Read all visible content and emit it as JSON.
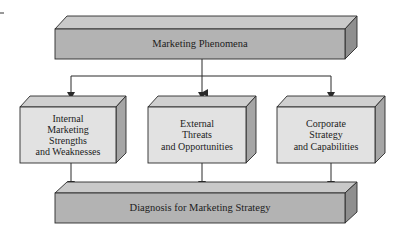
{
  "diagram": {
    "type": "flowchart",
    "colors": {
      "dark_box_front": "#b3b3b3",
      "dark_box_top": "#c9c9c9",
      "dark_box_side": "#8f8f8f",
      "light_box_front": "#e2e2e2",
      "light_box_top": "#cfcfcf",
      "light_box_side": "#a6a6a6",
      "stroke": "#2a2a2a",
      "text": "#1c1c1c"
    },
    "nodes": {
      "top": {
        "label": "Marketing Phenomena"
      },
      "internal": {
        "label": "Internal\nMarketing\nStrengths\nand Weaknesses"
      },
      "external": {
        "label": "External\nThreats\nand Opportunities"
      },
      "corporate": {
        "label": "Corporate\nStrategy\nand Capabilities"
      },
      "bottom": {
        "label": "Diagnosis for Marketing Strategy"
      }
    },
    "edges": [
      {
        "from": "Marketing Phenomena",
        "to": "Internal Marketing Strengths and Weaknesses"
      },
      {
        "from": "Marketing Phenomena",
        "to": "External Threats and Opportunities"
      },
      {
        "from": "Marketing Phenomena",
        "to": "Corporate Strategy and Capabilities"
      },
      {
        "from": "Internal Marketing Strengths and Weaknesses",
        "to": "Diagnosis for Marketing Strategy"
      },
      {
        "from": "External Threats and Opportunities",
        "to": "Diagnosis for Marketing Strategy"
      },
      {
        "from": "Corporate Strategy and Capabilities",
        "to": "Diagnosis for Marketing Strategy"
      }
    ]
  }
}
